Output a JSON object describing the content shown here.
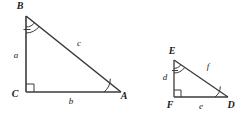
{
  "figure": {
    "stroke_color": "#3b3b3b",
    "label_color": "#1a1a1a",
    "background": "#ffffff"
  },
  "triangles": [
    {
      "id": "triangle-abc",
      "name": "left-triangle",
      "vertices": [
        {
          "key": "B",
          "label": "B",
          "x": 26,
          "y": 16,
          "label_x": 20,
          "label_y": 9
        },
        {
          "key": "C",
          "label": "C",
          "x": 26,
          "y": 92,
          "label_x": 15,
          "label_y": 97
        },
        {
          "key": "A",
          "label": "A",
          "x": 121,
          "y": 92,
          "label_x": 124,
          "label_y": 99
        }
      ],
      "sides": [
        {
          "key": "a",
          "label": "a",
          "label_x": 16,
          "label_y": 58,
          "between": "B-C"
        },
        {
          "key": "b",
          "label": "b",
          "label_x": 71,
          "label_y": 104,
          "between": "C-A"
        },
        {
          "key": "c",
          "label": "c",
          "label_x": 79,
          "label_y": 46,
          "between": "B-A"
        }
      ],
      "right_angle_at": "C",
      "marked_angles": [
        {
          "vertex": "B",
          "marks": 2,
          "tick": true
        },
        {
          "vertex": "A",
          "marks": 1,
          "tick": false
        }
      ]
    },
    {
      "id": "triangle-def",
      "name": "right-triangle",
      "vertices": [
        {
          "key": "E",
          "label": "E",
          "x": 174,
          "y": 60,
          "label_x": 168,
          "label_y": 54
        },
        {
          "key": "F",
          "label": "F",
          "x": 174,
          "y": 97,
          "label_x": 167,
          "label_y": 108
        },
        {
          "key": "D",
          "label": "D",
          "x": 228,
          "y": 97,
          "label_x": 230,
          "label_y": 108
        }
      ],
      "sides": [
        {
          "key": "d",
          "label": "d",
          "label_x": 165,
          "label_y": 79,
          "between": "E-F"
        },
        {
          "key": "e",
          "label": "e",
          "label_x": 200,
          "label_y": 109,
          "between": "F-D"
        },
        {
          "key": "f",
          "label": "f",
          "label_x": 207,
          "label_y": 69,
          "between": "E-D"
        }
      ],
      "right_angle_at": "F",
      "marked_angles": [
        {
          "vertex": "E",
          "marks": 2,
          "tick": true
        },
        {
          "vertex": "D",
          "marks": 1,
          "tick": false
        }
      ]
    }
  ]
}
